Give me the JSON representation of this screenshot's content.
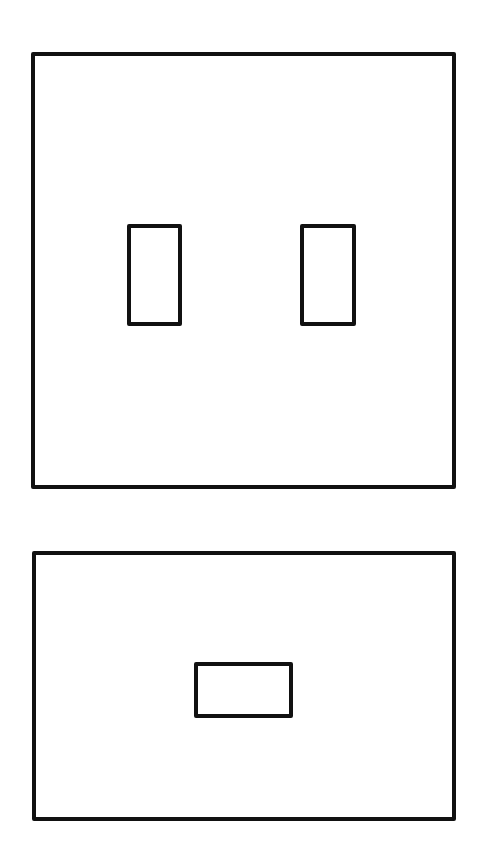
{
  "diagram": {
    "stroke_color": "#111111",
    "background": "#ffffff",
    "figures": [
      {
        "name": "upper-square-panel",
        "box": {
          "x": 31,
          "y": 52,
          "w": 425,
          "h": 437
        },
        "openings": [
          {
            "name": "left-vertical-slot",
            "x": 127,
            "y": 224,
            "w": 55,
            "h": 102
          },
          {
            "name": "right-vertical-slot",
            "x": 300,
            "y": 224,
            "w": 56,
            "h": 102
          }
        ]
      },
      {
        "name": "lower-rectangular-panel",
        "box": {
          "x": 32,
          "y": 551,
          "w": 424,
          "h": 270
        },
        "openings": [
          {
            "name": "center-horizontal-slot",
            "x": 194,
            "y": 662,
            "w": 99,
            "h": 56
          }
        ]
      }
    ]
  }
}
